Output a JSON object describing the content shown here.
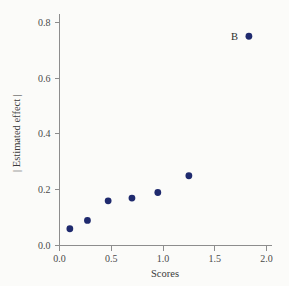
{
  "chart_data": {
    "type": "scatter",
    "title": "",
    "xlabel": "Scores",
    "ylabel": "| Estimated effect |",
    "xlim": [
      0.0,
      2.05
    ],
    "ylim": [
      0.0,
      0.83
    ],
    "grid": false,
    "legend": null,
    "marker_color": "#1f2a6e",
    "axis_color": "#8d8d8d",
    "background_color": "#fbfbf9",
    "xticks": [
      "0.0",
      "0.5",
      "1.0",
      "1.5",
      "2.0"
    ],
    "xtick_values": [
      0.0,
      0.5,
      1.0,
      1.5,
      2.0
    ],
    "yticks": [
      "0.0",
      "0.2",
      "0.4",
      "0.6",
      "0.8"
    ],
    "ytick_values": [
      0.0,
      0.2,
      0.4,
      0.6,
      0.8
    ],
    "points": [
      {
        "x": 0.1,
        "y": 0.06,
        "label": ""
      },
      {
        "x": 0.27,
        "y": 0.09,
        "label": ""
      },
      {
        "x": 0.47,
        "y": 0.16,
        "label": ""
      },
      {
        "x": 0.7,
        "y": 0.17,
        "label": ""
      },
      {
        "x": 0.95,
        "y": 0.19,
        "label": ""
      },
      {
        "x": 1.25,
        "y": 0.25,
        "label": ""
      },
      {
        "x": 1.83,
        "y": 0.75,
        "label": "B"
      }
    ],
    "annotations": [
      {
        "text": "B",
        "x": 1.83,
        "y": 0.75,
        "position": "left"
      }
    ]
  }
}
